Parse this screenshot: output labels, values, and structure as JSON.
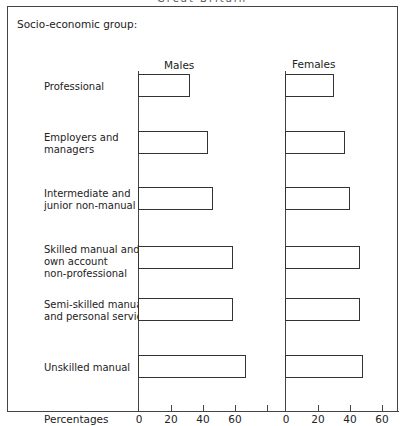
{
  "title": "Great Britain",
  "group_heading": "Socio-economic group:",
  "xlabel": "Percentages",
  "panels": [
    {
      "label": "Males",
      "axis_x": 139
    },
    {
      "label": "Females",
      "axis_x": 286
    }
  ],
  "ticks": [
    "0",
    "20",
    "40",
    "60"
  ],
  "categories": [
    {
      "label": "Professional",
      "y": 74,
      "label_y": 81
    },
    {
      "label": "Employers and\nmanagers",
      "y": 131,
      "label_y": 132
    },
    {
      "label": "Intermediate and\njunior non-manual",
      "y": 187,
      "label_y": 188
    },
    {
      "label": "Skilled manual and\nown account\nnon-professional",
      "y": 246,
      "label_y": 244
    },
    {
      "label": "Semi-skilled manual\nand personal service",
      "y": 298,
      "label_y": 299
    },
    {
      "label": "Unskilled manual",
      "y": 355,
      "label_y": 362
    }
  ],
  "chart_data": {
    "type": "bar",
    "orientation": "horizontal",
    "title": "Great Britain",
    "ylabel": "Socio-economic group",
    "xlabel": "Percentages",
    "categories": [
      "Professional",
      "Employers and managers",
      "Intermediate and junior non-manual",
      "Skilled manual and own account non-professional",
      "Semi-skilled manual and personal service",
      "Unskilled manual"
    ],
    "series": [
      {
        "name": "Males",
        "values": [
          32,
          43,
          46,
          59,
          59,
          67
        ]
      },
      {
        "name": "Females",
        "values": [
          30,
          37,
          40,
          46,
          46,
          48
        ]
      }
    ],
    "xlim": [
      0,
      70
    ],
    "xticks": [
      0,
      20,
      40,
      60
    ],
    "grid": false,
    "layout": "two side-by-side panels (Males, Females)"
  }
}
